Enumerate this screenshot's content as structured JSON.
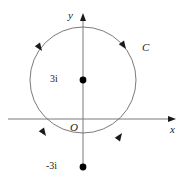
{
  "figure": {
    "type": "complex-plane-contour-diagram",
    "width": 183,
    "height": 194,
    "background_color": "#ffffff",
    "stroke_color": "#555555",
    "text_color": "#1a1a1a"
  },
  "axes": {
    "x_label": "x",
    "y_label": "y",
    "origin_label": "O",
    "x_axis_y_px": 119,
    "y_axis_x_px": 83,
    "x_axis_from_px": 8,
    "x_axis_to_px": 176,
    "y_axis_from_px": 170,
    "y_axis_to_px": 14,
    "arrowheads": [
      "x-positive",
      "y-positive"
    ]
  },
  "contour": {
    "label": "C",
    "center_x_px": 83,
    "center_y_px": 80,
    "radius_px": 53,
    "orientation": "counterclockwise",
    "arrow_count": 4,
    "arrow_angles_deg": [
      35,
      145,
      215,
      325
    ],
    "description": "circle of radius 3 centered at 3i"
  },
  "points": [
    {
      "id": "center-point",
      "label": "3i",
      "x_px": 83,
      "y_px": 80,
      "marker": "filled-dot",
      "label_side": "left"
    },
    {
      "id": "lower-point",
      "label": "-3i",
      "x_px": 83,
      "y_px": 167,
      "marker": "filled-dot",
      "label_side": "left"
    }
  ]
}
